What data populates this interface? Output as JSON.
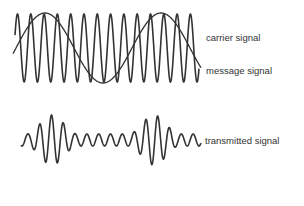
{
  "diagram": {
    "labels": {
      "carrier": "carrier signal",
      "message": "message signal",
      "transmitted": "transmitted signal"
    },
    "colors": {
      "stroke": "#333333",
      "text": "#333333",
      "background": "#ffffff"
    },
    "signals": {
      "carrier": {
        "x_start": 15,
        "x_end": 199,
        "center_y": 48,
        "amplitude": 34,
        "period": 13.3
      },
      "message": {
        "x_start": 13,
        "x_end": 201,
        "center_y": 48,
        "amplitude": 35,
        "period": 116
      },
      "transmitted": {
        "x_start": 21,
        "x_end": 201,
        "center_y": 140
      }
    }
  }
}
